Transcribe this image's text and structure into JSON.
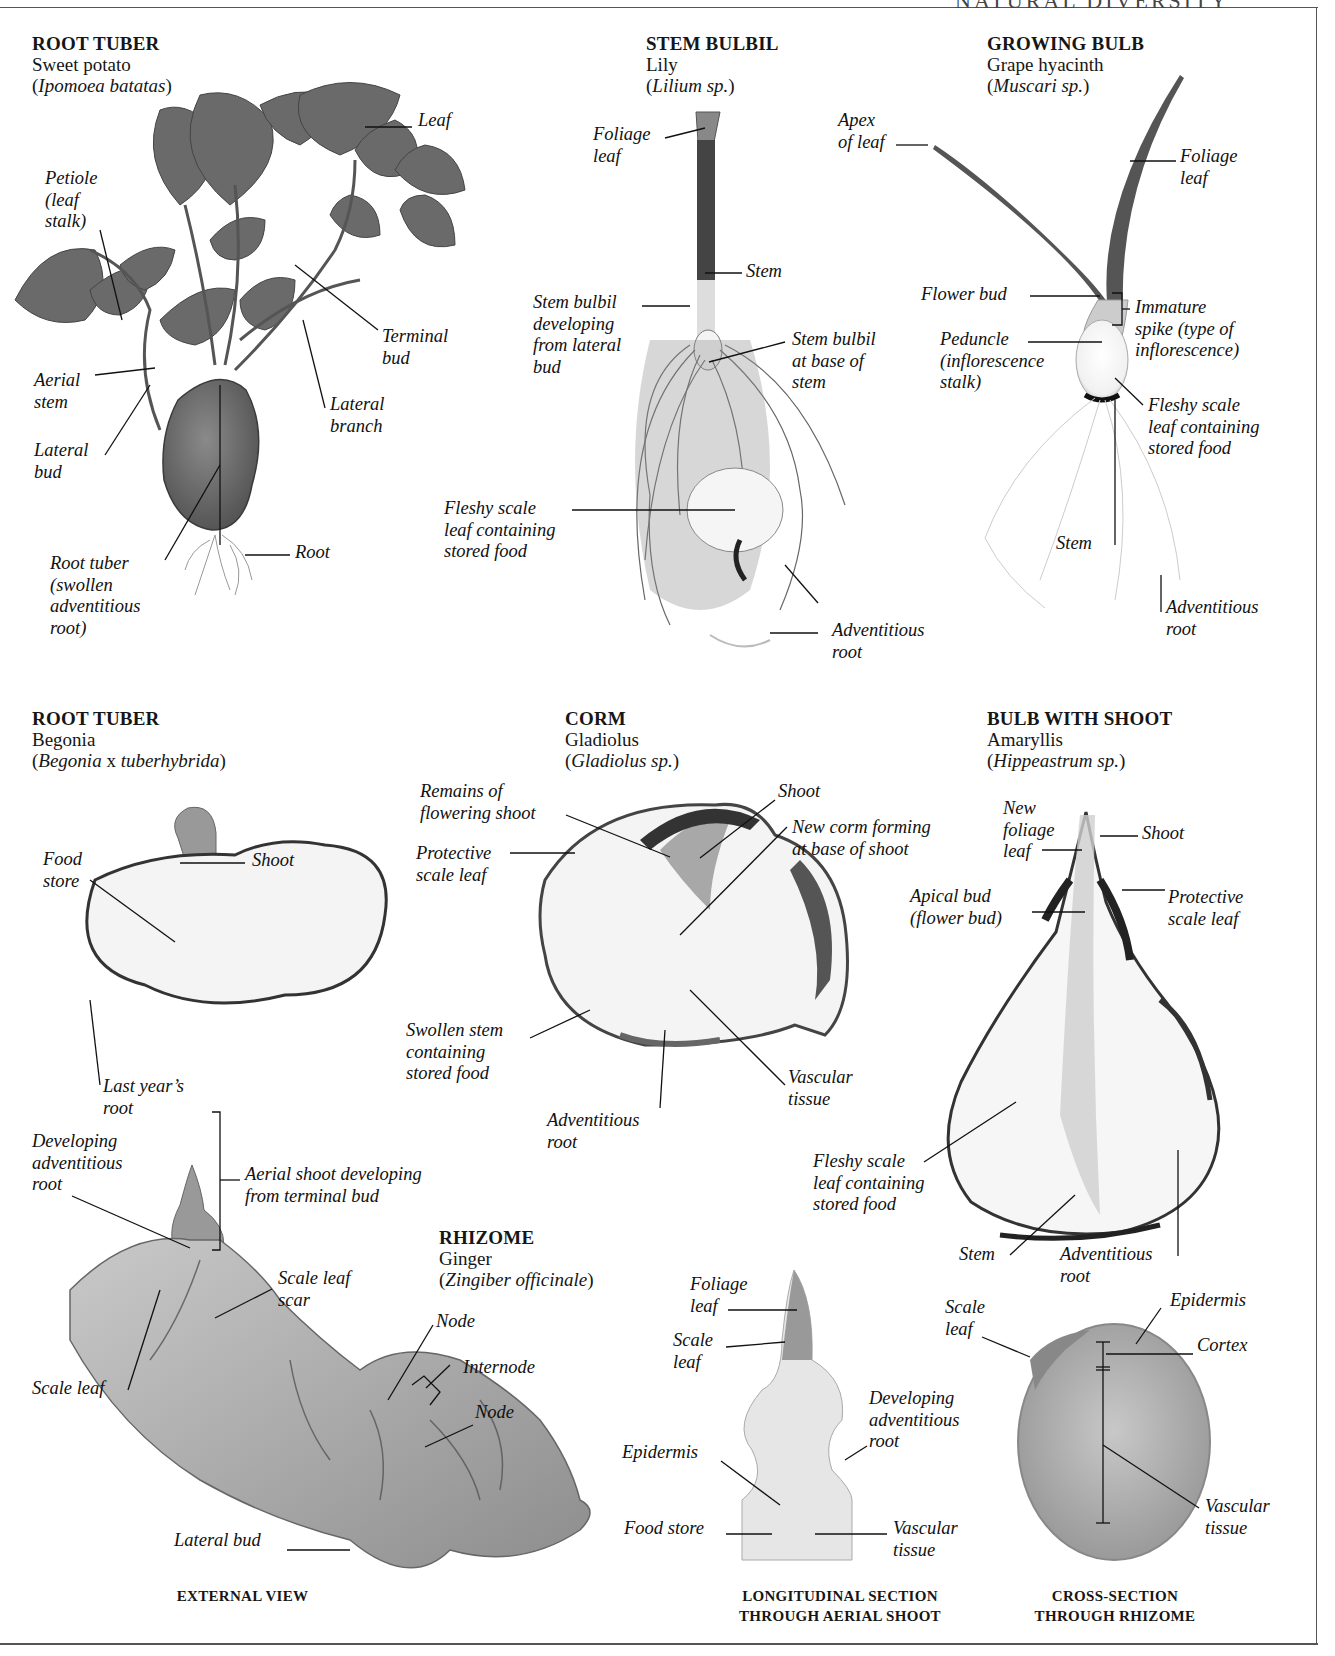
{
  "page": {
    "header_fragment": "NATURAL DIVERSITY"
  },
  "specimens": [
    {
      "id": "sweet-potato",
      "type": "ROOT TUBER",
      "common": "Sweet potato",
      "scientific": "Ipomoea batatas",
      "labels": [
        "Leaf",
        "Petiole\n(leaf\nstalk)",
        "Terminal\nbud",
        "Aerial\nstem",
        "Lateral\nbranch",
        "Lateral\nbud",
        "Root",
        "Root tuber\n(swollen\nadventitious\nroot)"
      ]
    },
    {
      "id": "lily",
      "type": "STEM BULBIL",
      "common": "Lily",
      "scientific": "Lilium sp.",
      "labels": [
        "Foliage\nleaf",
        "Stem",
        "Stem bulbil\ndeveloping\nfrom lateral\nbud",
        "Stem bulbil\nat base of\nstem",
        "Fleshy scale\nleaf containing\nstored food",
        "Adventitious\nroot"
      ]
    },
    {
      "id": "grape-hyacinth",
      "type": "GROWING BULB",
      "common": "Grape hyacinth",
      "scientific": "Muscari sp.",
      "labels": [
        "Apex\nof leaf",
        "Foliage\nleaf",
        "Flower bud",
        "Immature\nspike (type of\ninflorescence)",
        "Peduncle\n(inflorescence\nstalk)",
        "Fleshy scale\nleaf containing\nstored food",
        "Stem",
        "Adventitious\nroot"
      ]
    },
    {
      "id": "begonia",
      "type": "ROOT TUBER",
      "common": "Begonia",
      "scientific": "Begonia x tuberhybrida",
      "scientific_parts": [
        "Begonia",
        " x ",
        "tuberhybrida"
      ],
      "labels": [
        "Food\nstore",
        "Shoot",
        "Last year’s\nroot"
      ]
    },
    {
      "id": "gladiolus",
      "type": "CORM",
      "common": "Gladiolus",
      "scientific": "Gladiolus sp.",
      "labels": [
        "Remains of\nflowering shoot",
        "Shoot",
        "New corm forming\nat base of shoot",
        "Protective\nscale leaf",
        "Swollen stem\ncontaining\nstored food",
        "Vascular\ntissue",
        "Adventitious\nroot"
      ]
    },
    {
      "id": "amaryllis",
      "type": "BULB WITH SHOOT",
      "common": "Amaryllis",
      "scientific": "Hippeastrum sp.",
      "labels": [
        "New\nfoliage\nleaf",
        "Shoot",
        "Apical bud\n(flower bud)",
        "Protective\nscale leaf",
        "Fleshy scale\nleaf containing\nstored food",
        "Stem",
        "Adventitious\nroot"
      ]
    },
    {
      "id": "ginger",
      "type": "RHIZOME",
      "common": "Ginger",
      "scientific": "Zingiber officinale",
      "labels": [
        "Developing\nadventitious\nroot",
        "Aerial shoot developing\nfrom terminal bud",
        "Scale leaf\nscar",
        "Node",
        "Internode",
        "Node",
        "Scale leaf",
        "Lateral bud"
      ],
      "views": [
        {
          "caption": "EXTERNAL VIEW",
          "labels": []
        },
        {
          "caption": "LONGITUDINAL SECTION\nTHROUGH AERIAL SHOOT",
          "labels": [
            "Foliage\nleaf",
            "Scale\nleaf",
            "Developing\nadventitious\nroot",
            "Epidermis",
            "Food store",
            "Vascular\ntissue"
          ]
        },
        {
          "caption": "CROSS-SECTION\nTHROUGH RHIZOME",
          "labels": [
            "Scale\nleaf",
            "Epidermis",
            "Cortex",
            "Vascular\ntissue"
          ]
        }
      ]
    }
  ],
  "colors": {
    "background": "#ffffff",
    "text": "#161616",
    "frame": "#555555",
    "leaf_dark": "#5a5a5a",
    "tuber": "#6e6e6e",
    "section_flesh": "#f4f4f4",
    "ginger_skin": "#b4b4b4"
  }
}
